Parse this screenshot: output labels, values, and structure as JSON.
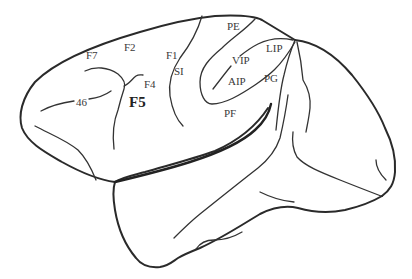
{
  "figure": {
    "colors": {
      "line": "#2a2a2a",
      "text": "#3a3a3a",
      "background": "#ffffff"
    }
  },
  "labels": {
    "f7": "F7",
    "f2": "F2",
    "f1": "F1",
    "si": "SI",
    "f4": "F4",
    "f5": "F5",
    "a46": "46",
    "pe": "PE",
    "vip": "VIP",
    "lip": "LIP",
    "aip": "AIP",
    "pg": "PG",
    "pf": "PF"
  }
}
